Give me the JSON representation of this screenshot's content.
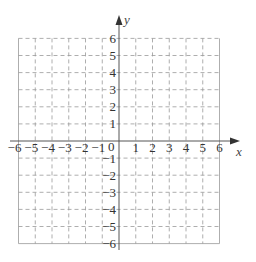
{
  "chart_data": {
    "type": "coordinate-grid",
    "title": "",
    "xlabel": "x",
    "ylabel": "y",
    "xlim": [
      -6,
      6
    ],
    "ylim": [
      -6,
      6
    ],
    "grid": "dashed",
    "x_ticks": [
      -6,
      -5,
      -4,
      -3,
      -2,
      -1,
      1,
      2,
      3,
      4,
      5,
      6
    ],
    "y_ticks": [
      -6,
      -5,
      -4,
      -3,
      -2,
      -1,
      1,
      2,
      3,
      4,
      5,
      6
    ],
    "origin_label": "0",
    "x_tick_labels": [
      "−6",
      "−5",
      "−4",
      "−3",
      "−2",
      "−1",
      "1",
      "2",
      "3",
      "4",
      "5",
      "6"
    ],
    "y_tick_labels": [
      "−6",
      "−5",
      "−4",
      "−3",
      "−2",
      "−1",
      "1",
      "2",
      "3",
      "4",
      "5",
      "6"
    ]
  },
  "axes": {
    "x_name": "x",
    "y_name": "y",
    "origin": "0"
  },
  "colors": {
    "grid": "#999999",
    "axis": "#555555",
    "text": "#333333"
  }
}
